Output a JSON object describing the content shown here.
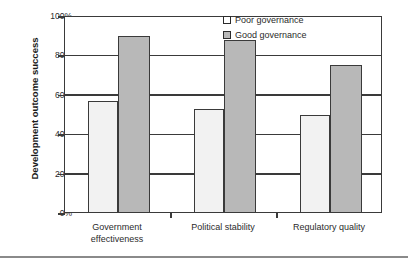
{
  "chart_data": {
    "type": "bar",
    "title": "",
    "xlabel": "",
    "ylabel": "Development outcome success",
    "categories": [
      "Government effectiveness",
      "Political stability",
      "Regulatory quality"
    ],
    "category_lines": [
      [
        "Government",
        "effectiveness"
      ],
      [
        "Political stability"
      ],
      [
        "Regulatory quality"
      ]
    ],
    "series": [
      {
        "name": "Poor governance",
        "values": [
          57,
          53,
          50
        ],
        "color": "#f2f2f2"
      },
      {
        "name": "Good governance",
        "values": [
          90,
          88,
          75
        ],
        "color": "#b8b8b8"
      }
    ],
    "ylim": [
      0,
      100
    ],
    "yticks": [
      0,
      20,
      40,
      60,
      80,
      100
    ],
    "ytick_labels": [
      "0%",
      "20%",
      "40%",
      "60%",
      "80%",
      "100%"
    ],
    "grid": true,
    "legend_position": "top-right",
    "value_format": "percent"
  },
  "axis": {
    "y_title": "Development outcome success",
    "ticks": [
      {
        "label": "100%",
        "value": 100
      },
      {
        "label": "80%",
        "value": 80
      },
      {
        "label": "60%",
        "value": 60
      },
      {
        "label": "40%",
        "value": 40
      },
      {
        "label": "20%",
        "value": 20
      },
      {
        "label": "0%",
        "value": 0
      }
    ]
  },
  "legend": {
    "items": [
      {
        "label": "Poor governance",
        "swatch": "light"
      },
      {
        "label": "Good governance",
        "swatch": "gray"
      }
    ]
  },
  "x_labels": {
    "g0_line1": "Government",
    "g0_line2": "effectiveness",
    "g1_line1": "Political stability",
    "g2_line1": "Regulatory quality"
  },
  "colors": {
    "poor_fill": "#f2f2f2",
    "good_fill": "#b8b8b8",
    "axis_line": "#3a3a3a",
    "background": "#ffffff"
  }
}
